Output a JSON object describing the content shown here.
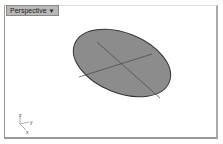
{
  "viewport": {
    "title": "Perspective",
    "menu_icon": "chevron-down-icon",
    "axes": {
      "z": "z",
      "y": "y",
      "x": "x"
    },
    "object": {
      "type": "ellipse",
      "fill": "#8c8c8c",
      "stroke": "#333333"
    }
  }
}
